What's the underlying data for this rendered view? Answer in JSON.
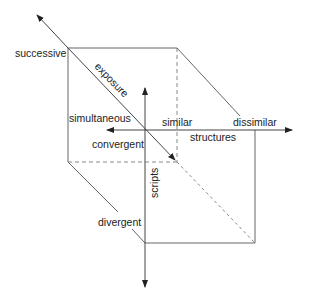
{
  "diagram": {
    "type": "3d-cube-axes",
    "colors": {
      "line": "#555555",
      "dashed": "#888888",
      "text": "#222222"
    },
    "axes": {
      "exposure": {
        "label": "exposure",
        "pole_back": "successive",
        "pole_front": "simultaneous"
      },
      "structures": {
        "label": "structures",
        "pole_left": "similar",
        "pole_right": "dissimilar"
      },
      "scripts": {
        "label": "scripts",
        "pole_top": "convergent",
        "pole_bottom": "divergent"
      }
    },
    "labels": {
      "successive": "successive",
      "exposure": "exposure",
      "simultaneous": "simultaneous",
      "similar": "similar",
      "dissimilar": "dissimilar",
      "structures": "structures",
      "convergent": "convergent",
      "scripts": "scripts",
      "divergent": "divergent"
    }
  }
}
